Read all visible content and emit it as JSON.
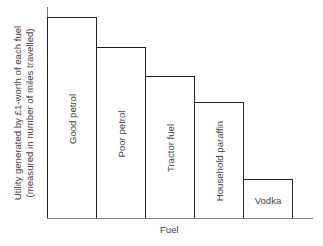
{
  "chart_data": {
    "type": "bar",
    "title": "",
    "xlabel": "Fuel",
    "ylabel": "Utility generated by £1-worth of each fuel (measured in number of miles travelled)",
    "ylabel_line1": "Utility generated by £1-worth of each fuel",
    "ylabel_line2": "(measured in number of miles travelled)",
    "categories": [
      "Good petrol",
      "Poor petrol",
      "Tractor fuel",
      "Household paraffin",
      "Vodka"
    ],
    "values": [
      100,
      85,
      71,
      58,
      20
    ],
    "value_units": "relative (no numeric axis shown)",
    "grid": false,
    "legend": null,
    "bar_label_orientation": [
      "vertical",
      "vertical",
      "vertical",
      "vertical",
      "horizontal"
    ]
  }
}
